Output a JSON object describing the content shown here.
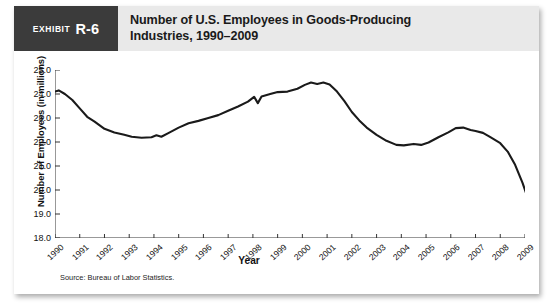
{
  "exhibit": {
    "word": "Exhibit",
    "number": "R-6"
  },
  "title": {
    "line1": "Number of U.S. Employees in Goods-Producing",
    "line2": "Industries, 1990–2009"
  },
  "source": "Source: Bureau of Labor Statistics.",
  "chart_data": {
    "type": "line",
    "title": "Number of U.S. Employees in Goods-Producing Industries, 1990–2009",
    "xlabel": "Year",
    "ylabel": "Number of Employees (in millions)",
    "xlim": [
      1990,
      2009
    ],
    "ylim": [
      18.0,
      25.0
    ],
    "ytick_labels": [
      "18.0",
      "19.0",
      "20.0",
      "21.0",
      "22.0",
      "23.0",
      "24.0",
      "25.0"
    ],
    "yticks": [
      18.0,
      19.0,
      20.0,
      21.0,
      22.0,
      23.0,
      24.0,
      25.0
    ],
    "categories": [
      "1990",
      "1991",
      "1992",
      "1993",
      "1994",
      "1995",
      "1996",
      "1997",
      "1998",
      "1999",
      "2000",
      "2001",
      "2002",
      "2003",
      "2004",
      "2005",
      "2006",
      "2007",
      "2008",
      "2009"
    ],
    "grid": false,
    "legend": false,
    "line_color": "#1a1a1a",
    "series": [
      {
        "name": "Goods-producing employees (millions)",
        "values": [
          24.1,
          23.15,
          22.45,
          22.2,
          22.78,
          23.15,
          23.35,
          23.88,
          24.35,
          24.5,
          24.6,
          23.9,
          22.55,
          21.85,
          21.9,
          22.25,
          22.6,
          22.25,
          21.35,
          18.45
        ]
      }
    ],
    "points": [
      [
        1990.0,
        24.1
      ],
      [
        1990.15,
        24.15
      ],
      [
        1990.4,
        24.0
      ],
      [
        1990.7,
        23.75
      ],
      [
        1991.0,
        23.4
      ],
      [
        1991.3,
        23.05
      ],
      [
        1991.6,
        22.85
      ],
      [
        1992.0,
        22.55
      ],
      [
        1992.4,
        22.4
      ],
      [
        1992.8,
        22.3
      ],
      [
        1993.1,
        22.22
      ],
      [
        1993.5,
        22.18
      ],
      [
        1993.9,
        22.2
      ],
      [
        1994.1,
        22.28
      ],
      [
        1994.3,
        22.22
      ],
      [
        1994.6,
        22.38
      ],
      [
        1995.0,
        22.6
      ],
      [
        1995.4,
        22.78
      ],
      [
        1995.8,
        22.88
      ],
      [
        1996.2,
        23.0
      ],
      [
        1996.6,
        23.12
      ],
      [
        1997.0,
        23.3
      ],
      [
        1997.4,
        23.48
      ],
      [
        1997.8,
        23.68
      ],
      [
        1998.05,
        23.88
      ],
      [
        1998.2,
        23.62
      ],
      [
        1998.35,
        23.9
      ],
      [
        1998.7,
        24.0
      ],
      [
        1999.0,
        24.08
      ],
      [
        1999.4,
        24.1
      ],
      [
        1999.8,
        24.22
      ],
      [
        2000.1,
        24.38
      ],
      [
        2000.35,
        24.48
      ],
      [
        2000.6,
        24.42
      ],
      [
        2000.85,
        24.48
      ],
      [
        2001.1,
        24.4
      ],
      [
        2001.4,
        24.1
      ],
      [
        2001.7,
        23.7
      ],
      [
        2002.0,
        23.25
      ],
      [
        2002.3,
        22.9
      ],
      [
        2002.6,
        22.6
      ],
      [
        2003.0,
        22.3
      ],
      [
        2003.4,
        22.05
      ],
      [
        2003.8,
        21.88
      ],
      [
        2004.1,
        21.86
      ],
      [
        2004.5,
        21.92
      ],
      [
        2004.8,
        21.88
      ],
      [
        2005.1,
        21.98
      ],
      [
        2005.5,
        22.2
      ],
      [
        2005.9,
        22.4
      ],
      [
        2006.2,
        22.58
      ],
      [
        2006.5,
        22.6
      ],
      [
        2006.8,
        22.5
      ],
      [
        2007.0,
        22.46
      ],
      [
        2007.3,
        22.38
      ],
      [
        2007.6,
        22.2
      ],
      [
        2008.0,
        21.95
      ],
      [
        2008.3,
        21.6
      ],
      [
        2008.6,
        21.05
      ],
      [
        2008.9,
        20.3
      ],
      [
        2009.2,
        19.4
      ],
      [
        2009.6,
        18.75
      ],
      [
        2009.9,
        18.42
      ]
    ]
  }
}
